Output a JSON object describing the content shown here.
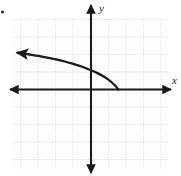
{
  "figure": {
    "corner_mark": "•",
    "x_axis_label": "x",
    "y_axis_label": "y",
    "background_color": "#ffffff",
    "grid_color": "#c9c9c9",
    "axis_color": "#1a1a1a",
    "curve_color": "#1a1a1a"
  },
  "chart_data": {
    "type": "line",
    "title": "",
    "subtitle": "",
    "xlabel": "x",
    "ylabel": "y",
    "xlim": [
      -4.5,
      4.5
    ],
    "ylim": [
      -4.5,
      5.0
    ],
    "grid": true,
    "grid_spacing": 1,
    "legend": "none",
    "legend_position": "none",
    "axes_style": "arrows-both-ends",
    "annotations": [
      {
        "type": "arrowhead",
        "at_x": -4.2,
        "at_y": 2.1,
        "direction": "left"
      },
      {
        "type": "endpoint",
        "at_x": 1.55,
        "at_y": 0.0
      }
    ],
    "series": [
      {
        "name": "curve",
        "x": [
          -4.2,
          -3.9,
          -3.5,
          -3.0,
          -2.5,
          -2.0,
          -1.5,
          -1.0,
          -0.5,
          0.0,
          0.4,
          0.8,
          1.1,
          1.3,
          1.45,
          1.55
        ],
        "y": [
          2.1,
          2.06,
          2.0,
          1.92,
          1.82,
          1.72,
          1.6,
          1.46,
          1.3,
          1.1,
          0.92,
          0.7,
          0.48,
          0.3,
          0.15,
          0.0
        ]
      }
    ]
  }
}
